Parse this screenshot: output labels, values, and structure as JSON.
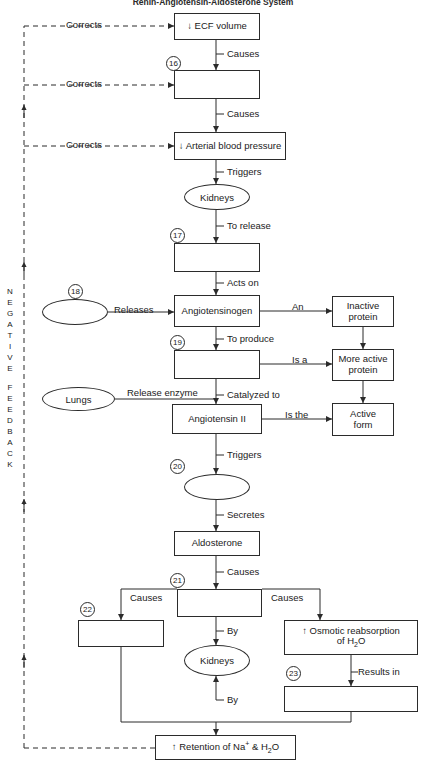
{
  "title": "Renin-Angiotensin-Aldosterone System",
  "feedback_label": {
    "word1": "NEGATIVE",
    "word2": "FEEDBACK",
    "full": "NEGATIVE FEEDBACK"
  },
  "nodes": {
    "ecf_volume": {
      "text": "↓ ECF volume",
      "shape": "box",
      "filled": true
    },
    "blank_16": {
      "text": "",
      "shape": "box",
      "filled": false,
      "number": "16"
    },
    "arterial_bp": {
      "text": "↓ Arterial blood pressure",
      "shape": "box",
      "filled": true
    },
    "kidneys_top": {
      "text": "Kidneys",
      "shape": "ellipse",
      "filled": true
    },
    "blank_17": {
      "text": "",
      "shape": "box",
      "filled": false,
      "number": "17"
    },
    "blank_18": {
      "text": "",
      "shape": "ellipse",
      "filled": false,
      "number": "18"
    },
    "angiotensinogen": {
      "text": "Angiotensinogen",
      "shape": "box",
      "filled": true
    },
    "blank_19": {
      "text": "",
      "shape": "box",
      "filled": false,
      "number": "19"
    },
    "lungs": {
      "text": "Lungs",
      "shape": "ellipse",
      "filled": true
    },
    "angiotensin_ii": {
      "text": "Angiotensin II",
      "shape": "box",
      "filled": true
    },
    "inactive_protein": {
      "text": "Inactive protein",
      "shape": "box",
      "filled": true
    },
    "more_active_protein": {
      "text": "More active protein",
      "shape": "box",
      "filled": true
    },
    "active_form": {
      "text": "Active form",
      "shape": "box",
      "filled": true
    },
    "blank_20": {
      "text": "",
      "shape": "ellipse",
      "filled": false,
      "number": "20"
    },
    "aldosterone": {
      "text": "Aldosterone",
      "shape": "box",
      "filled": true
    },
    "blank_21": {
      "text": "",
      "shape": "box",
      "filled": false,
      "number": "21"
    },
    "blank_22": {
      "text": "",
      "shape": "box",
      "filled": false,
      "number": "22"
    },
    "kidneys_bottom": {
      "text": "Kidneys",
      "shape": "ellipse",
      "filled": true
    },
    "osmotic_reabsorption": {
      "text": "↑ Osmotic reabsorption of H2O",
      "shape": "box",
      "filled": true
    },
    "blank_23": {
      "text": "",
      "shape": "box",
      "filled": false,
      "number": "23"
    },
    "retention": {
      "text": "↑ Retention of Na+ & H2O",
      "shape": "box",
      "filled": true
    }
  },
  "edge_labels": {
    "corrects_1": "Corrects",
    "corrects_2": "Corrects",
    "corrects_3": "Corrects",
    "causes_1": "Causes",
    "causes_2": "Causes",
    "triggers_1": "Triggers",
    "to_release": "To release",
    "acts_on": "Acts on",
    "releases": "Releases",
    "an": "An",
    "to_produce": "To produce",
    "is_a": "Is a",
    "release_enzyme": "Release enzyme",
    "catalyzed_to": "Catalyzed to",
    "is_the": "Is the",
    "triggers_2": "Triggers",
    "secretes": "Secretes",
    "causes_3": "Causes",
    "causes_left": "Causes",
    "causes_right": "Causes",
    "by_1": "By",
    "by_2": "By",
    "results_in": "Results in"
  },
  "numbers": {
    "n16": "16",
    "n17": "17",
    "n18": "18",
    "n19": "19",
    "n20": "20",
    "n21": "21",
    "n22": "22",
    "n23": "23"
  },
  "colors": {
    "stroke": "#2b2b2b",
    "text": "#1a1a1a",
    "background": "#ffffff"
  }
}
